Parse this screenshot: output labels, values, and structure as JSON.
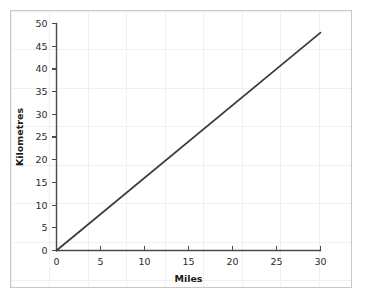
{
  "figure": {
    "background_color": "#ffffff",
    "frame_color": "#c8c8c8",
    "grid_color": "#f0f0f2"
  },
  "chart_data": {
    "type": "line",
    "title": "",
    "subtitle": "",
    "xlabel": "Miles",
    "ylabel": "Kilometres",
    "xlim": [
      0,
      30
    ],
    "ylim": [
      0,
      50
    ],
    "grid": true,
    "legend": null,
    "legend_position": "none",
    "line_color": "#3a3a3a",
    "xticks": [
      0,
      5,
      10,
      15,
      20,
      25,
      30
    ],
    "xtick_labels": [
      "0",
      "5",
      "10",
      "15",
      "20",
      "25",
      "30"
    ],
    "yticks": [
      0,
      5,
      10,
      15,
      20,
      25,
      30,
      35,
      40,
      45,
      50
    ],
    "ytick_labels": [
      "0",
      "5",
      "10",
      "15",
      "20",
      "25",
      "30",
      "35",
      "40",
      "45",
      "50"
    ],
    "series": [
      {
        "name": "miles-to-kilometres",
        "x": [
          0,
          30
        ],
        "values": [
          0,
          48
        ],
        "slope": 1.6,
        "points": [
          {
            "x": 0,
            "y": 0
          },
          {
            "x": 5,
            "y": 8
          },
          {
            "x": 10,
            "y": 16
          },
          {
            "x": 15,
            "y": 24
          },
          {
            "x": 20,
            "y": 32
          },
          {
            "x": 25,
            "y": 40
          },
          {
            "x": 30,
            "y": 48
          }
        ]
      }
    ],
    "annotations": []
  }
}
